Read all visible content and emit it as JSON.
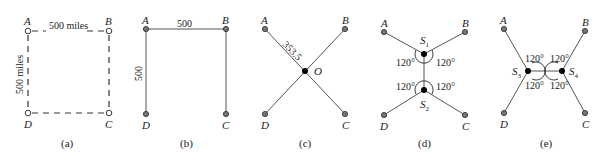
{
  "diagram": {
    "panels": [
      {
        "id": "a",
        "caption": "(a)",
        "nodes": {
          "A": "A",
          "B": "B",
          "C": "C",
          "D": "D"
        },
        "top_label": "500 miles",
        "side_label": "500 miles"
      },
      {
        "id": "b",
        "caption": "(b)",
        "nodes": {
          "A": "A",
          "B": "B",
          "C": "C",
          "D": "D"
        },
        "top_label": "500",
        "side_label": "500"
      },
      {
        "id": "c",
        "caption": "(c)",
        "nodes": {
          "A": "A",
          "B": "B",
          "C": "C",
          "D": "D",
          "O": "O"
        },
        "diag_label": "353.5"
      },
      {
        "id": "d",
        "caption": "(d)",
        "nodes": {
          "A": "A",
          "B": "B",
          "C": "C",
          "D": "D"
        },
        "steiner": [
          {
            "base": "S",
            "sub": "1"
          },
          {
            "base": "S",
            "sub": "2"
          }
        ],
        "angles": [
          "120°",
          "120°",
          "120°",
          "120°"
        ]
      },
      {
        "id": "e",
        "caption": "(e)",
        "nodes": {
          "A": "A",
          "B": "B",
          "C": "C",
          "D": "D"
        },
        "steiner": [
          {
            "base": "S",
            "sub": "3"
          },
          {
            "base": "S",
            "sub": "4"
          }
        ],
        "angles": [
          "120°",
          "120°",
          "120°",
          "120°"
        ]
      }
    ]
  }
}
